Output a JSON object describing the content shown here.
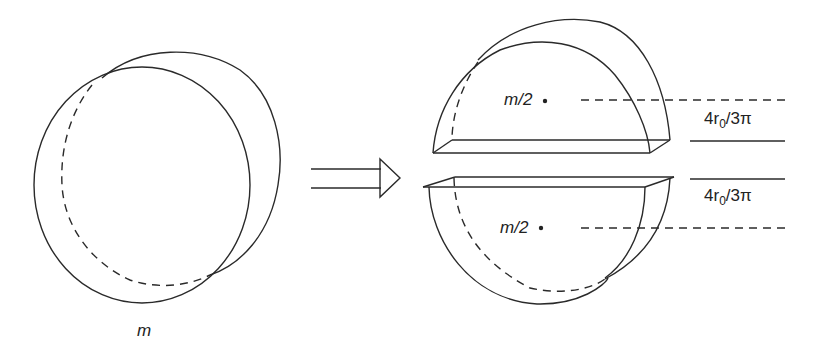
{
  "diagram": {
    "whole_disk": {
      "mass_label": "m"
    },
    "arrow": {
      "direction": "right",
      "style": "double-line hollow arrow"
    },
    "upper_half": {
      "mass_label": "m/2",
      "distance_label": "4r",
      "distance_subscript": "0",
      "distance_suffix": "/3π"
    },
    "lower_half": {
      "mass_label": "m/2",
      "distance_label": "4r",
      "distance_subscript": "0",
      "distance_suffix": "/3π"
    },
    "colors": {
      "line": "#2a2a2a",
      "background": "#ffffff"
    }
  }
}
